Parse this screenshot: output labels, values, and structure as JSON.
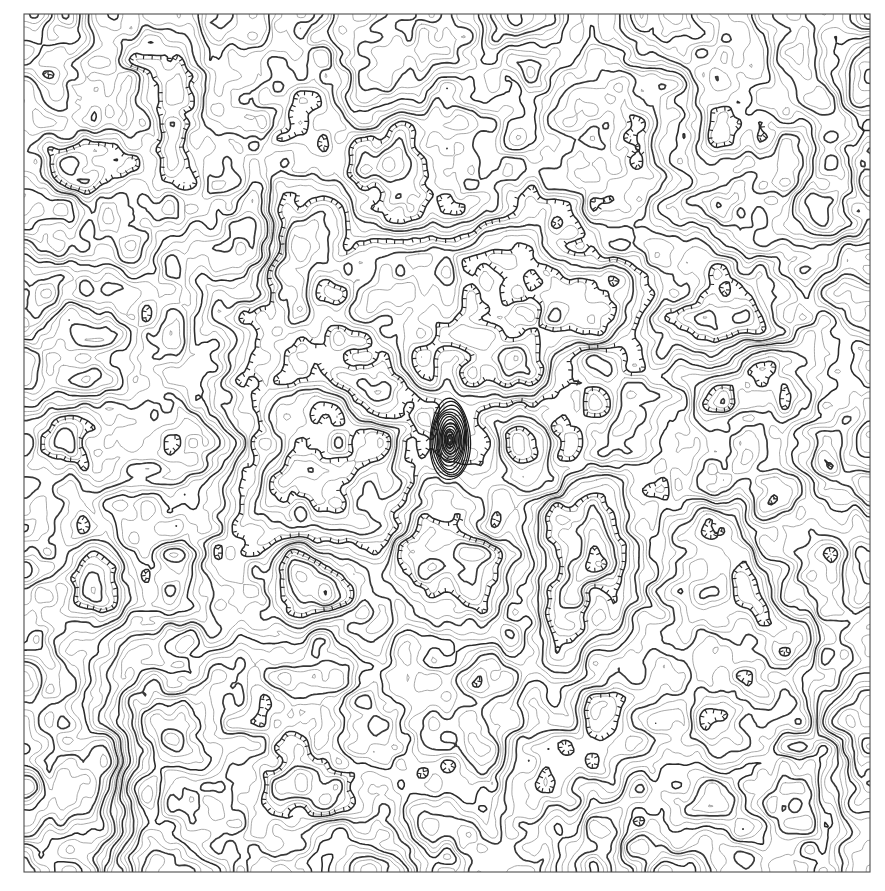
{
  "figure": {
    "title": "",
    "subtitle": "",
    "background_color": "#ffffff",
    "width": 885,
    "height": 891
  },
  "axes": {
    "frame": {
      "x": 24,
      "y": 14,
      "width": 846,
      "height": 858
    },
    "frame_color": "#4d4d4d",
    "xlabel": "",
    "ylabel": "",
    "xticklabels": [],
    "yticklabels": [],
    "grid": false,
    "spines_visible": true
  },
  "styles": {
    "minor_contour_color": "#9a9a9a",
    "major_contour_color": "#3a3a3a",
    "hachure_contour_color": "#2b2b2b",
    "core_contour_color": "#1a1a1a",
    "minor_linewidth": 0.85,
    "major_linewidth": 1.7,
    "hachure_linewidth": 1.55
  },
  "chart_data": {
    "type": "contour",
    "title": "",
    "xlabel": "",
    "ylabel": "",
    "xlim": [
      -1.0,
      1.0
    ],
    "ylim": [
      -1.0,
      1.0
    ],
    "grid": false,
    "legend": null,
    "colormap": "grayscale-lines",
    "filled": false,
    "n_levels": 24,
    "level_step": 0.25,
    "levels": [
      -3.0,
      -2.75,
      -2.5,
      -2.25,
      -2.0,
      -1.75,
      -1.5,
      -1.25,
      -1.0,
      -0.75,
      -0.5,
      -0.25,
      0.0,
      0.25,
      0.5,
      0.75,
      1.0,
      1.25,
      1.5,
      1.75,
      2.0,
      2.25,
      2.5,
      2.75,
      3.0
    ],
    "index_contour_every": 4,
    "depression_contours_hachured": true,
    "singularity": {
      "label": "central pole",
      "x_px": 450,
      "y_px": 440,
      "description": "dense concentric contours converging at field singularity"
    },
    "field": {
      "description": "pseudo-random smooth 2-D scalar field with a pole at the centre",
      "resolution": [
        256,
        256
      ],
      "value_min": -3.0,
      "value_max": 3.0
    },
    "annotations": []
  }
}
